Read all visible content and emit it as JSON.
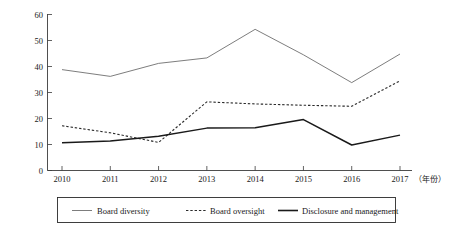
{
  "chart_data": {
    "type": "line",
    "title": "",
    "subtitle": "",
    "xlabel": "（年份）",
    "ylabel": "",
    "categories": [
      "2010",
      "2011",
      "2012",
      "2013",
      "2014",
      "2015",
      "2016",
      "2017"
    ],
    "x": [
      2010,
      2011,
      2012,
      2013,
      2014,
      2015,
      2016,
      2017
    ],
    "xlim": [
      2010,
      2017
    ],
    "ylim": [
      0,
      60
    ],
    "yticks": [
      0,
      10,
      20,
      30,
      40,
      50,
      60
    ],
    "ytick_labels": [
      "0",
      "10",
      "20",
      "30",
      "40",
      "50",
      "60"
    ],
    "grid": false,
    "legend_position": "below",
    "series": [
      {
        "name": "Board diversity",
        "style": "solid-thin",
        "color": "#6e6e6e",
        "values": [
          38.8,
          36.2,
          41.2,
          43.3,
          54.3,
          44.5,
          33.8,
          44.8
        ]
      },
      {
        "name": "Board oversight",
        "style": "dashed",
        "color": "#2b2b2b",
        "values": [
          17.2,
          14.5,
          10.8,
          26.4,
          25.6,
          25.1,
          24.7,
          34.5
        ]
      },
      {
        "name": "Disclosure and management",
        "style": "solid-thick",
        "color": "#1a1a1a",
        "values": [
          10.7,
          11.3,
          13.2,
          16.3,
          16.4,
          19.6,
          9.8,
          13.6
        ]
      }
    ]
  },
  "axis": {
    "y_labels": [
      "60",
      "50",
      "40",
      "30",
      "20",
      "10",
      "0"
    ],
    "x_labels": [
      "2010",
      "2011",
      "2012",
      "2013",
      "2014",
      "2015",
      "2016",
      "2017"
    ],
    "x_unit_note": "（年份）"
  },
  "legend": {
    "entries": [
      {
        "label": "Board diversity",
        "marker": "line-solid-thin"
      },
      {
        "label": "Board oversight",
        "marker": "line-dashed"
      },
      {
        "label": "Disclosure and management",
        "marker": "line-solid-thick"
      }
    ]
  }
}
